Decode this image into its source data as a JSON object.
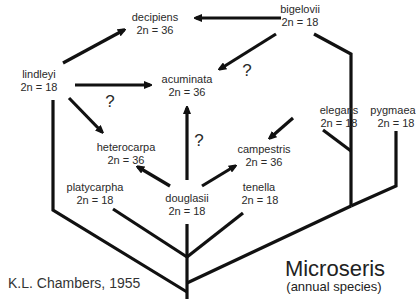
{
  "title": "Microseris",
  "subtitle": "(annual species)",
  "citation": "K.L. Chambers, 1955",
  "uncertain_marker": "?",
  "species": [
    {
      "name": "decipiens",
      "chromosomes": "2n = 36"
    },
    {
      "name": "bigelovii",
      "chromosomes": "2n = 18"
    },
    {
      "name": "lindleyi",
      "chromosomes": "2n = 18"
    },
    {
      "name": "acuminata",
      "chromosomes": "2n = 36"
    },
    {
      "name": "elegans",
      "chromosomes": "2n = 18"
    },
    {
      "name": "pygmaea",
      "chromosomes": "2n = 18"
    },
    {
      "name": "heterocarpa",
      "chromosomes": "2n = 36"
    },
    {
      "name": "campestris",
      "chromosomes": "2n = 36"
    },
    {
      "name": "platycarpha",
      "chromosomes": "2n = 18"
    },
    {
      "name": "douglasii",
      "chromosomes": "2n = 18"
    },
    {
      "name": "tenella",
      "chromosomes": "2n = 18"
    }
  ],
  "hybridization_arrows": [
    {
      "from": "bigelovii",
      "to": "decipiens",
      "uncertain": false
    },
    {
      "from": "lindleyi",
      "to": "decipiens",
      "uncertain": false
    },
    {
      "from": "lindleyi",
      "to": "acuminata",
      "uncertain": true
    },
    {
      "from": "bigelovii",
      "to": "acuminata",
      "uncertain": true
    },
    {
      "from": "douglasii",
      "to": "acuminata",
      "uncertain": true
    },
    {
      "from": "lindleyi",
      "to": "heterocarpa",
      "uncertain": false
    },
    {
      "from": "douglasii",
      "to": "heterocarpa",
      "uncertain": false
    },
    {
      "from": "douglasii",
      "to": "campestris",
      "uncertain": false
    },
    {
      "from": "elegans",
      "to": "campestris",
      "uncertain": false
    }
  ],
  "colors": {
    "line": "#111111",
    "text": "#2a2a2a",
    "background": "#ffffff"
  }
}
